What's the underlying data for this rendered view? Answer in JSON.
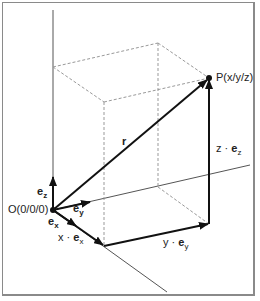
{
  "diagram": {
    "labels": {
      "point": "P(x/y/z)",
      "origin": "O(0/0/0)",
      "r": "r",
      "ez": "e",
      "ez_sub": "z",
      "ey": "e",
      "ey_sub": "y",
      "ex": "e",
      "ex_sub": "x",
      "x_comp_pre": "x · ",
      "x_comp_e": "e",
      "x_comp_sub": "x",
      "y_comp_pre": "y · ",
      "y_comp_e": "e",
      "y_comp_sub": "y",
      "z_comp_pre": "z · ",
      "z_comp_e": "e",
      "z_comp_sub": "z"
    },
    "colors": {
      "vector": "#111111",
      "axis": "#555555",
      "dashed": "#999999",
      "border": "#8a8a8a"
    }
  }
}
